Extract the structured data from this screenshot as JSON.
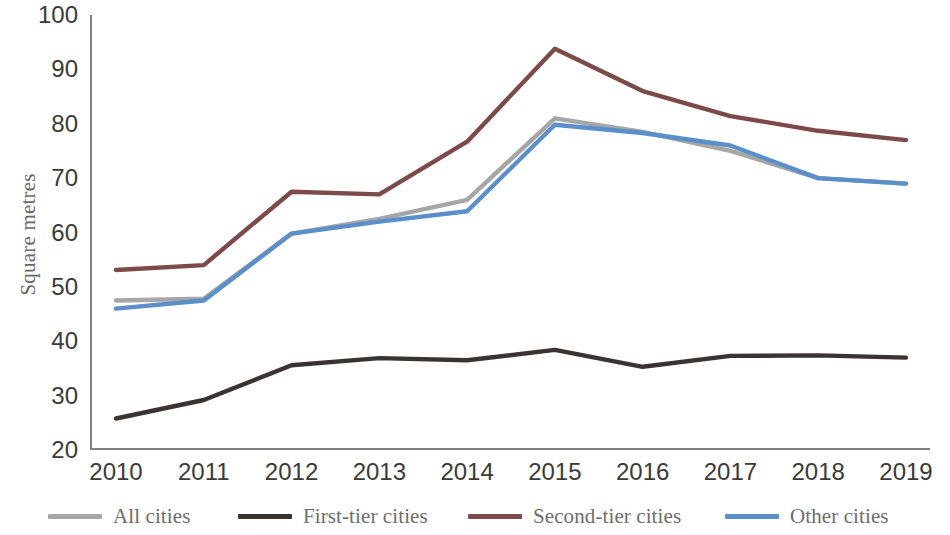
{
  "chart_data": {
    "type": "line",
    "title": "",
    "xlabel": "",
    "ylabel": "Square metres",
    "categories": [
      "2010",
      "2011",
      "2012",
      "2013",
      "2014",
      "2015",
      "2016",
      "2017",
      "2018",
      "2019"
    ],
    "ylim": [
      20,
      100
    ],
    "yticks": [
      20,
      30,
      40,
      50,
      60,
      70,
      80,
      90,
      100
    ],
    "grid": false,
    "legend_position": "bottom",
    "series": [
      {
        "name": "All cities",
        "color": "#a6a6a6",
        "values": [
          47.5,
          47.8,
          59.8,
          62.5,
          66.0,
          81.0,
          78.5,
          75.0,
          70.0,
          69.0
        ]
      },
      {
        "name": "First-tier cities",
        "color": "#3b332f",
        "values": [
          25.8,
          29.2,
          35.6,
          36.9,
          36.5,
          38.4,
          35.3,
          37.3,
          37.4,
          37.0
        ]
      },
      {
        "name": "Second-tier cities",
        "color": "#7c4a49",
        "values": [
          53.1,
          54.0,
          67.5,
          67.0,
          76.7,
          93.8,
          86.0,
          81.4,
          78.7,
          77.0
        ]
      },
      {
        "name": "Other cities",
        "color": "#5b8fc9",
        "values": [
          46.0,
          47.5,
          59.8,
          62.0,
          63.9,
          79.8,
          78.3,
          76.0,
          70.0,
          69.0
        ]
      }
    ]
  },
  "legend": {
    "items": [
      {
        "label": "All cities",
        "color": "#a6a6a6",
        "left": 48
      },
      {
        "label": "First-tier cities",
        "color": "#3b332f",
        "left": 238
      },
      {
        "label": "Second-tier cities",
        "color": "#7c4a49",
        "left": 468
      },
      {
        "label": "Other cities",
        "color": "#5b8fc9",
        "left": 725
      }
    ]
  },
  "axis": {
    "y_title": "Square metres"
  }
}
